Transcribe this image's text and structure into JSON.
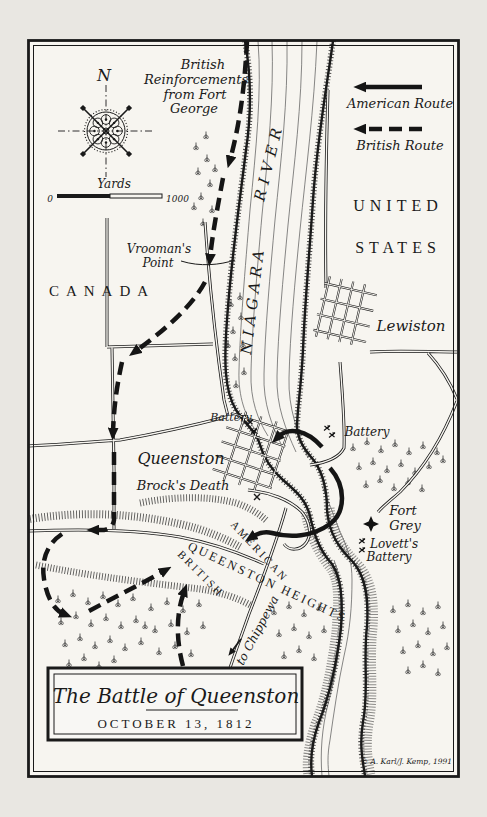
{
  "colors": {
    "ink": "#1a1a1a",
    "paper": "#f7f5f0",
    "margin": "#e9e7e2"
  },
  "compass": {
    "north": "N"
  },
  "scale": {
    "label": "Yards",
    "start": "0",
    "end": "1000"
  },
  "legend": {
    "american": "American Route",
    "british": "British Route"
  },
  "regions": {
    "canada": "CANADA",
    "us1": "UNITED",
    "us2": "STATES"
  },
  "river": {
    "name1": "NIAGARA",
    "name2": "RIVER"
  },
  "routes": {
    "reinforce1": "British",
    "reinforce2": "Reinforcements",
    "reinforce3": "from Fort",
    "reinforce4": "George",
    "american": "AMERICAN",
    "british": "BRITISH",
    "to_chippewa": "to Chippewa"
  },
  "places": {
    "vroomans1": "Vrooman's",
    "vroomans2": "Point",
    "lewiston": "Lewiston",
    "battery_canada": "Battery",
    "battery_us": "Battery",
    "queenston": "Queenston",
    "brocks_death": "Brock's Death",
    "fort_grey1": "Fort",
    "fort_grey2": "Grey",
    "lovetts1": "Lovett's",
    "lovetts2": "Battery",
    "heights": "QUEENSTON HEIGHTS"
  },
  "title": {
    "line1": "The Battle of Queenston",
    "line2": "OCTOBER 13, 1812"
  },
  "credit": "© A. Karl/J. Kemp, 1991"
}
